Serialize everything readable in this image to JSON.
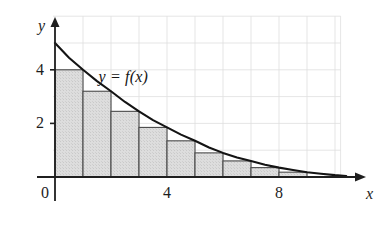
{
  "figure": {
    "background": "#ffffff",
    "grid_color": "#dedede",
    "axis_color": "#1f1f1f",
    "curve_color": "#141414",
    "bar_fill": "#d9d9d9",
    "bar_edge": "#4a4a4a"
  },
  "labels": {
    "y_axis": "y",
    "x_axis": "x",
    "curve": "y = f(x)"
  },
  "chart_data": {
    "type": "bar",
    "title": "",
    "subtitle": "",
    "xlabel": "x",
    "ylabel": "y",
    "annotations": [
      "y = f(x)"
    ],
    "grid": true,
    "legend": "none",
    "xlim": [
      0,
      10.5
    ],
    "ylim": [
      0,
      6
    ],
    "x_ticks": [
      0,
      4,
      8
    ],
    "x_tick_labels": [
      "0",
      "4",
      "8"
    ],
    "y_ticks": [
      2,
      4
    ],
    "y_tick_labels": [
      "2",
      "4"
    ],
    "rectangle_rule": "right endpoint",
    "rectangle_width": 1,
    "categories": [
      "1",
      "2",
      "3",
      "4",
      "5",
      "6",
      "7",
      "8",
      "9"
    ],
    "bar_left_edges": [
      0,
      1,
      2,
      3,
      4,
      5,
      6,
      7,
      8
    ],
    "bar_right_edges": [
      1,
      2,
      3,
      4,
      5,
      6,
      7,
      8,
      9
    ],
    "values": [
      4.0,
      3.2,
      2.45,
      1.85,
      1.35,
      0.9,
      0.6,
      0.35,
      0.18
    ],
    "series": [
      {
        "name": "f(x)",
        "type": "line",
        "x": [
          0,
          0.5,
          1,
          1.5,
          2,
          2.5,
          3,
          3.5,
          4,
          4.5,
          5,
          5.5,
          6,
          6.5,
          7,
          7.5,
          8,
          8.5,
          9,
          9.5,
          10,
          10.4
        ],
        "y": [
          5.0,
          4.45,
          4.0,
          3.58,
          3.2,
          2.8,
          2.45,
          2.12,
          1.85,
          1.58,
          1.35,
          1.1,
          0.9,
          0.73,
          0.6,
          0.46,
          0.35,
          0.26,
          0.18,
          0.12,
          0.07,
          0.04
        ]
      }
    ]
  }
}
